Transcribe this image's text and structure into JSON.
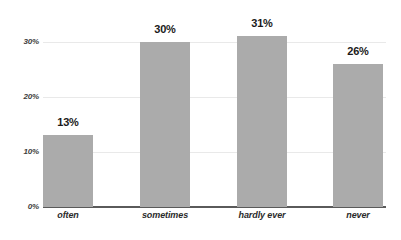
{
  "chart_data": {
    "type": "bar",
    "title": "",
    "subtitle": "",
    "xlabel": "",
    "ylabel": "",
    "categories": [
      "often",
      "sometimes",
      "hardly ever",
      "never"
    ],
    "values": [
      13,
      30,
      31,
      26
    ],
    "value_labels": [
      "13%",
      "30%",
      "31%",
      "26%"
    ],
    "ylim": [
      0,
      35
    ],
    "yticks": [
      0,
      10,
      20,
      30
    ],
    "ytick_labels": [
      "0%",
      "10%",
      "20%",
      "30%"
    ],
    "grid": true,
    "legend": false,
    "series": [
      {
        "name": "",
        "values": [
          13,
          30,
          31,
          26
        ]
      }
    ]
  },
  "style": {
    "bar_color": "#ababab",
    "gridline_color": "#e9e9e9",
    "axis_color": "#5a5a5a",
    "label_color": "#1a1a1a",
    "tick_color": "#3d3d3d",
    "background": "#ffffff"
  }
}
